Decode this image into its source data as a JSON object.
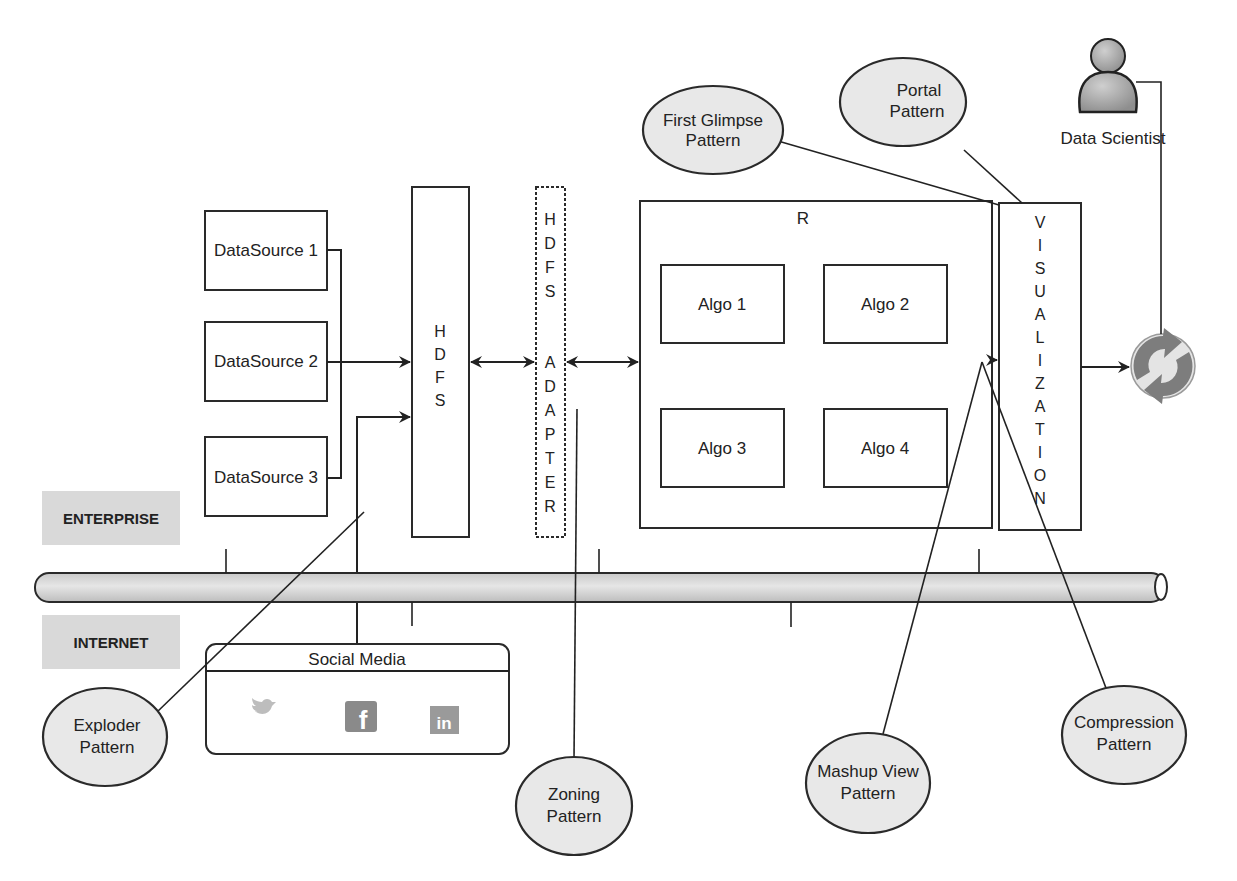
{
  "diagram": {
    "zones": {
      "enterprise": "ENTERPRISE",
      "internet": "INTERNET"
    },
    "data_sources": [
      {
        "label": "DataSource 1"
      },
      {
        "label": "DataSource 2"
      },
      {
        "label": "DataSource 3"
      }
    ],
    "hdfs": {
      "letters": [
        "H",
        "D",
        "F",
        "S"
      ]
    },
    "hdfs_adapter": {
      "letters": [
        "H",
        "D",
        "F",
        "S",
        "",
        "A",
        "D",
        "A",
        "P",
        "T",
        "E",
        "R"
      ]
    },
    "r_engine": {
      "title": "R",
      "algos": [
        {
          "label": "Algo 1"
        },
        {
          "label": "Algo 2"
        },
        {
          "label": "Algo 3"
        },
        {
          "label": "Algo 4"
        }
      ]
    },
    "visualization": {
      "letters": [
        "V",
        "I",
        "S",
        "U",
        "A",
        "L",
        "I",
        "Z",
        "A",
        "T",
        "I",
        "O",
        "N"
      ]
    },
    "data_scientist": {
      "label": "Data Scientist"
    },
    "social_media": {
      "title": "Social Media",
      "icons": [
        "twitter-icon",
        "facebook-icon",
        "linkedin-icon"
      ]
    },
    "patterns": {
      "first_glimpse": [
        "First Glimpse",
        "Pattern"
      ],
      "portal": [
        "Portal",
        "Pattern"
      ],
      "exploder": [
        "Exploder",
        "Pattern"
      ],
      "zoning": [
        "Zoning",
        "Pattern"
      ],
      "mashup_view": [
        "Mashup View",
        "Pattern"
      ],
      "compression": [
        "Compression",
        "Pattern"
      ]
    },
    "colors": {
      "stroke": "#2a2a2a",
      "ellipse_fill": "#e8e8e8",
      "zone_fill": "#d9d9d9",
      "icon_gray": "#8a8a8a"
    }
  }
}
